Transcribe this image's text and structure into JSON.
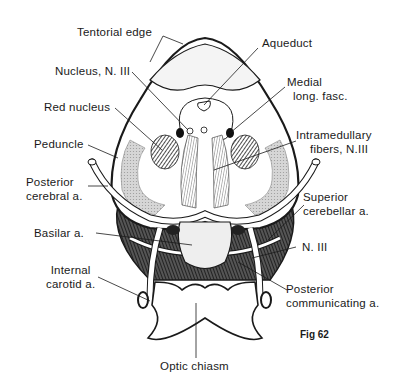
{
  "figure": {
    "caption": "Fig 62"
  },
  "labels": {
    "tentorial_edge": "Tentorial edge",
    "aqueduct": "Aqueduct",
    "nucleus_n3": "Nucleus, N. III",
    "medial_long_fasc_1": "Medial",
    "medial_long_fasc_2": "long. fasc.",
    "red_nucleus": "Red nucleus",
    "intramedullary_1": "Intramedullary",
    "intramedullary_2": "fibers, N.III",
    "peduncle": "Peduncle",
    "posterior_cerebral_1": "Posterior",
    "posterior_cerebral_2": "cerebral a.",
    "superior_cerebellar_1": "Superior",
    "superior_cerebellar_2": "cerebellar a.",
    "basilar": "Basilar a.",
    "n3": "N. III",
    "internal_carotid_1": "Internal",
    "internal_carotid_2": "carotid a.",
    "posterior_communicating_1": "Posterior",
    "posterior_communicating_2": "communicating a.",
    "optic_chiasm": "Optic chiasm"
  },
  "colors": {
    "ink": "#1a1a1a",
    "shade": "#bdbdbd",
    "dark": "#333333",
    "background": "#ffffff"
  }
}
